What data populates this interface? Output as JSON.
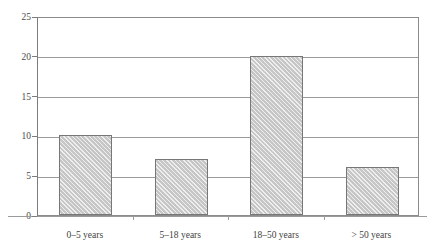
{
  "figure": {
    "top_bleed_text": "",
    "background": "#ffffff",
    "bar_fill": "#d3d3d3",
    "bar_edge": "#777777",
    "grid_color": "#9b9b9b",
    "axis_color": "#7d7d7d"
  },
  "chart_data": {
    "type": "bar",
    "title": "",
    "xlabel": "",
    "ylabel": "",
    "categories": [
      "0–5 years",
      "5–18 years",
      "18–50 years",
      "> 50 years"
    ],
    "values": [
      10,
      7,
      20,
      6
    ],
    "ylim": [
      0,
      25
    ],
    "yticks": [
      0,
      5,
      10,
      15,
      20,
      25
    ],
    "ytick_labels": [
      "0",
      "5",
      "10",
      "15",
      "20",
      "25"
    ],
    "grid": "horizontal",
    "legend": "none",
    "series": [
      {
        "name": "count",
        "values": [
          10,
          7,
          20,
          6
        ]
      }
    ]
  }
}
